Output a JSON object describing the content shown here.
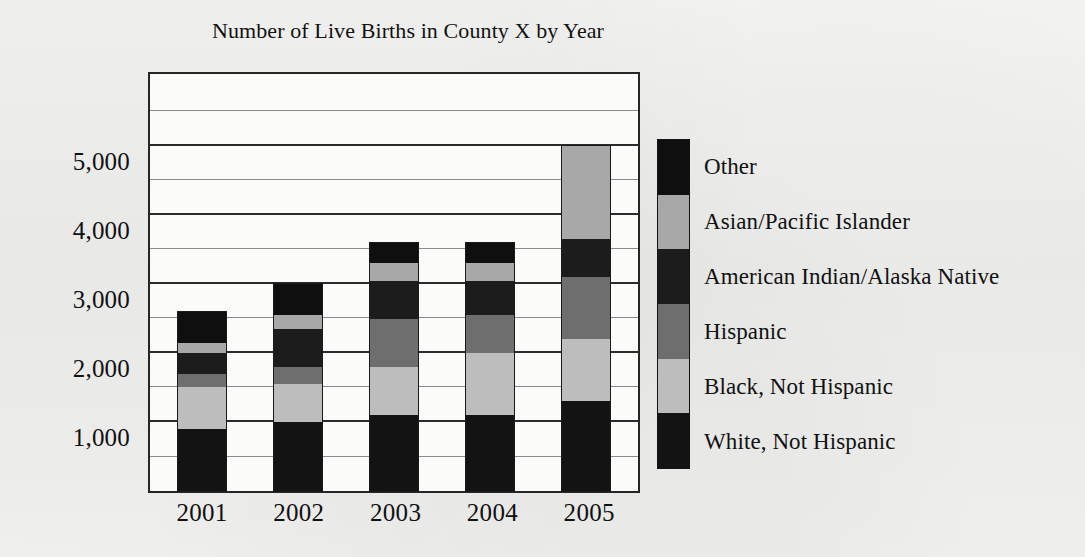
{
  "chart_data": {
    "type": "bar",
    "subtype": "stacked-bar",
    "title": "Number of Live Births in County X by Year",
    "xlabel": "",
    "ylabel": "",
    "categories": [
      "2001",
      "2002",
      "2003",
      "2004",
      "2005"
    ],
    "ylim": [
      0,
      6100
    ],
    "ytick_labels": [
      "1,000",
      "2,000",
      "3,000",
      "4,000",
      "5,000"
    ],
    "yticks": [
      1000,
      2000,
      3000,
      4000,
      5000
    ],
    "minor_yticks": [
      500,
      1500,
      2500,
      3500,
      4500,
      5500
    ],
    "grid": true,
    "legend_position": "right",
    "stack_order_bottom_to_top": [
      "White, Not Hispanic",
      "Black, Not Hispanic",
      "Hispanic",
      "American Indian/Alaska Native",
      "Asian/Pacific Islander",
      "Other"
    ],
    "series": [
      {
        "name": "White, Not Hispanic",
        "color": "#131313",
        "values": [
          900,
          1000,
          1100,
          1100,
          1300
        ]
      },
      {
        "name": "Black, Not Hispanic",
        "color": "#bdbdbd",
        "values": [
          600,
          550,
          700,
          900,
          900
        ]
      },
      {
        "name": "Hispanic",
        "color": "#6e6e6e",
        "values": [
          200,
          250,
          700,
          550,
          900
        ]
      },
      {
        "name": "American Indian/Alaska Native",
        "color": "#1c1c1c",
        "values": [
          300,
          550,
          550,
          500,
          550
        ]
      },
      {
        "name": "Asian/Pacific Islander",
        "color": "#a8a8a8",
        "values": [
          150,
          200,
          250,
          250,
          1350
        ]
      },
      {
        "name": "Other",
        "color": "#0f0f0f",
        "values": [
          450,
          450,
          300,
          300,
          0
        ]
      }
    ],
    "totals": [
      2600,
      3000,
      3600,
      3600,
      5000
    ]
  },
  "legend": {
    "items": [
      {
        "label": "Other",
        "color": "#0f0f0f"
      },
      {
        "label": "Asian/Pacific Islander",
        "color": "#a8a8a8"
      },
      {
        "label": "American Indian/Alaska Native",
        "color": "#1c1c1c"
      },
      {
        "label": "Hispanic",
        "color": "#6e6e6e"
      },
      {
        "label": "Black, Not Hispanic",
        "color": "#bdbdbd"
      },
      {
        "label": "White, Not Hispanic",
        "color": "#131313"
      }
    ]
  },
  "colors": {
    "background": "#f2f2f0",
    "plot_background": "#fbfbfa",
    "axis": "#262626",
    "gridline_major": "#2b2b2b",
    "gridline_minor": "#8a8a8a",
    "text": "#111111"
  }
}
